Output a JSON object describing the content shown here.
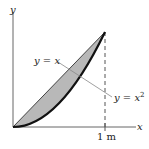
{
  "diagram": {
    "axes": {
      "x_label": "x",
      "y_label": "y"
    },
    "curves": [
      {
        "name": "line",
        "label_lhs": "y = ",
        "label_rhs": "x",
        "equation": "y = x"
      },
      {
        "name": "parabola",
        "label_lhs": "y = ",
        "label_rhs": "x",
        "exponent": "2",
        "equation": "y = x^2"
      }
    ],
    "tick_label": "1 m",
    "colors": {
      "shaded_region": "#b8b8b8",
      "curve": "#1a1a1a",
      "axis": "#555555",
      "leader": "#777777"
    }
  }
}
